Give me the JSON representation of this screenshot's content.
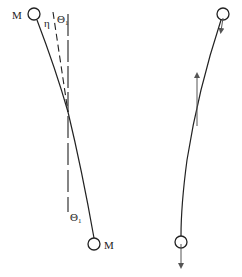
{
  "figure": {
    "left_panel": {
      "mass_top_label": "M",
      "mass_bottom_label": "M",
      "eta_label": "η",
      "theta_top_label": "Θ",
      "theta_top_sub": "1",
      "theta_bottom_label": "Θ",
      "theta_bottom_sub": "1"
    },
    "right_panel": {
      "arrows": [
        "down-arrow-top-mass",
        "up-arrow-middle",
        "down-arrow-bottom-mass"
      ]
    },
    "colors": {
      "stroke": "#222222",
      "arrow": "#555555",
      "background": "#ffffff"
    }
  }
}
